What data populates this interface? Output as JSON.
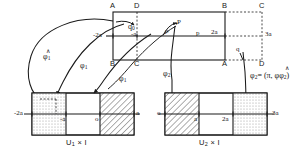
{
  "figure": {
    "title": ""
  },
  "top_rect": {
    "corners": {
      "top_left": "A",
      "top_mid": "D",
      "top_right": "B",
      "outer_top_right": "C",
      "bottom_left": "B",
      "bottom_mid": "C",
      "bottom_right": "A",
      "outer_bottom_right": "D"
    },
    "axis_labels": {
      "left": "-2a",
      "minus_a": "-a",
      "two_a": "2a",
      "right_outer": "3a"
    },
    "points": {
      "q0": "q",
      "q0_sub": "0",
      "P": "P",
      "rho": "ρ",
      "p": "p",
      "q": "q"
    }
  },
  "arrows": {
    "phi1_a": "φ",
    "phi1_a_sub": "1",
    "phi1_b": "φ",
    "phi1_b_sub": "1",
    "phi1_c": "φ",
    "phi1_c_sub": "1",
    "phi2_a": "φ",
    "phi2_a_sub": "2",
    "phi2_eq": "φ",
    "phi2_eq_sub": "2",
    "phi2_eq_rest": "= (π, φ",
    "phi2_eq_rest2": ")",
    "phi2_eq_inner_sub": "2",
    "hat": "∧"
  },
  "bottom_left": {
    "caption_u": "U",
    "caption_sub": "1",
    "caption_rest": " × I",
    "ticks": [
      "-2a",
      "-a",
      "o",
      "a"
    ]
  },
  "bottom_right": {
    "caption_u": "U",
    "caption_sub": "2",
    "caption_rest": " × I",
    "ticks": [
      "o",
      "a",
      "2a",
      "3a"
    ]
  },
  "colors": {
    "stroke": "#1a1a1a",
    "dot_fill": "#b9b9b9",
    "hatch": "#2a2a2a",
    "bg": "#ffffff"
  }
}
